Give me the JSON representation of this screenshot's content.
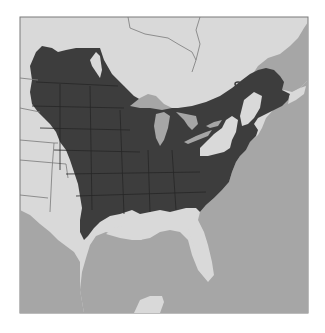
{
  "map": {
    "type": "species range map",
    "region": "Eastern North America",
    "colors": {
      "background": "#ffffff",
      "land": "#d9d9d9",
      "water": "#a6a6a6",
      "range": "#3d3d3d",
      "border": "#7a7a7a",
      "state_lines": "#2a2a2a"
    },
    "layers": [
      {
        "name": "range",
        "description": "Dark shaded distribution across eastern and central United States and southern Canada"
      },
      {
        "name": "water",
        "description": "Atlantic Ocean, Gulf of Mexico, Great Lakes, Gulf of St. Lawrence"
      },
      {
        "name": "land",
        "description": "Light gray land outside the range (western plains, Texas, Florida peninsula, Appalachian highlands, Quebec, Yucatan)"
      }
    ]
  }
}
